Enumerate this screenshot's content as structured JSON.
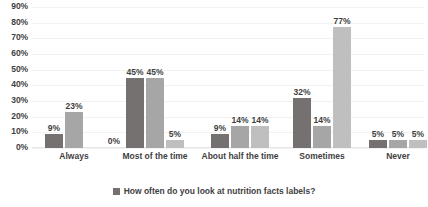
{
  "chart_data": {
    "type": "bar",
    "title": "",
    "xlabel": "",
    "ylabel": "",
    "ylim": [
      0,
      90
    ],
    "grid": true,
    "legend_position": "bottom",
    "categories": [
      "Always",
      "Most of the time",
      "About half the time",
      "Sometimes",
      "Never"
    ],
    "ticks": [
      "0%",
      "10%",
      "20%",
      "30%",
      "40%",
      "50%",
      "60%",
      "70%",
      "80%",
      "90%"
    ],
    "series": [
      {
        "name": "Series 1",
        "color": "#767171",
        "values": [
          9,
          45,
          9,
          32,
          5
        ],
        "labels": [
          "9%",
          "45%",
          "9%",
          "32%",
          "5%"
        ]
      },
      {
        "name": "Series 2",
        "color": "#a6a6a6",
        "values": [
          23,
          45,
          14,
          14,
          5
        ],
        "labels": [
          "23%",
          "45%",
          "14%",
          "14%",
          "5%"
        ]
      },
      {
        "name": "Series 3",
        "color": "#bfbfbf",
        "values": [
          0,
          5,
          14,
          77,
          5
        ],
        "labels": [
          "0%",
          "5%",
          "14%",
          "77%",
          "5%"
        ]
      }
    ],
    "legend": [
      {
        "label": "How often do you look at nutrition facts labels?",
        "color": "#767171"
      }
    ]
  }
}
